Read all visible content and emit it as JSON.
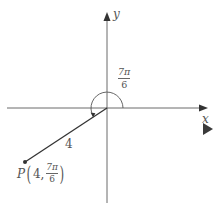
{
  "diagram": {
    "type": "polar-coordinate-plot",
    "axes": {
      "x_label": "x",
      "y_label": "y"
    },
    "angle": {
      "label_numerator": "7π",
      "label_denominator": "6"
    },
    "segment": {
      "length_label": "4"
    },
    "point": {
      "name": "P",
      "r": "4",
      "comma": ",",
      "theta_numerator": "7π",
      "theta_denominator": "6"
    }
  },
  "controls": {
    "next_icon": "play-triangle-icon"
  },
  "colors": {
    "axis": "#555555",
    "segment": "#333333",
    "text": "#555555",
    "play": "#3a3a3a"
  }
}
